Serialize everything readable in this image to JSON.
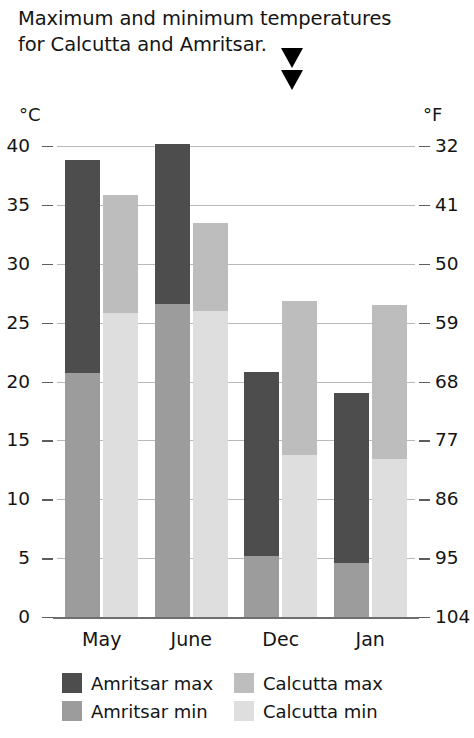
{
  "title": {
    "line1": "Maximum and minimum temperatures",
    "line2": "for Calcutta and Amritsar.",
    "marker_icon": "down-triangle-marker"
  },
  "chart_data": {
    "type": "bar",
    "title": "Maximum and minimum temperatures for Calcutta and Amritsar.",
    "subtitle": "",
    "xlabel": "",
    "ylabel": "°C",
    "y2label": "°F",
    "categories": [
      "May",
      "June",
      "Dec",
      "Jan"
    ],
    "series": [
      {
        "name": "Amritsar max",
        "color": "#4d4d4d",
        "values": [
          38.8,
          40.2,
          20.8,
          19.0
        ]
      },
      {
        "name": "Amritsar min",
        "color": "#9c9c9c",
        "values": [
          20.7,
          26.6,
          5.2,
          4.6
        ]
      },
      {
        "name": "Calcutta max",
        "color": "#bdbdbd",
        "values": [
          35.8,
          33.5,
          26.8,
          26.5
        ]
      },
      {
        "name": "Calcutta min",
        "color": "#dedede",
        "values": [
          25.8,
          26.0,
          13.8,
          13.4
        ]
      }
    ],
    "ylim": [
      0,
      40
    ],
    "yticks": [
      0,
      5,
      10,
      15,
      20,
      25,
      30,
      35,
      40
    ],
    "y2ticks": [
      32,
      41,
      50,
      59,
      68,
      77,
      86,
      95,
      104
    ],
    "grid": true,
    "legend_position": "bottom",
    "bar_style": "overlaid min-over-max, two groups of two bars per category"
  },
  "axes": {
    "left_unit": "°C",
    "right_unit": "°F",
    "left_ticks": [
      "40",
      "35",
      "30",
      "25",
      "20",
      "15",
      "10",
      "5",
      "0"
    ],
    "right_ticks": [
      "104",
      "95",
      "86",
      "77",
      "68",
      "59",
      "50",
      "41",
      "32"
    ]
  },
  "legend": {
    "items": [
      {
        "label": "Amritsar max",
        "color": "#4d4d4d"
      },
      {
        "label": "Calcutta max",
        "color": "#bdbdbd"
      },
      {
        "label": "Amritsar min",
        "color": "#9c9c9c"
      },
      {
        "label": "Calcutta min",
        "color": "#dedede"
      }
    ]
  }
}
